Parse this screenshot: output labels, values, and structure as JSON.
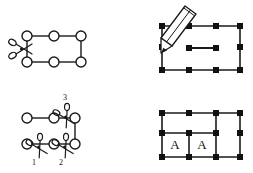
{
  "figure": {
    "background_color": "#ffffff",
    "stroke_color": "#1a1a1a",
    "node_fill_open": "#ffffff",
    "node_fill_solid": "#111111",
    "width": 253,
    "height": 173
  },
  "panels": [
    {
      "id": "top-left",
      "name": "single-cut-circle-graph",
      "caption": "",
      "node_style": "open-circle",
      "nodes": [
        {
          "id": "n1",
          "x": 27,
          "y": 36
        },
        {
          "id": "n2",
          "x": 54,
          "y": 36
        },
        {
          "id": "n3",
          "x": 81,
          "y": 36
        },
        {
          "id": "n4",
          "x": 27,
          "y": 62
        },
        {
          "id": "n5",
          "x": 54,
          "y": 62
        },
        {
          "id": "n6",
          "x": 81,
          "y": 62
        }
      ],
      "edges": [
        {
          "from": "n1",
          "to": "n2"
        },
        {
          "from": "n2",
          "to": "n3"
        },
        {
          "from": "n3",
          "to": "n6"
        },
        {
          "from": "n4",
          "to": "n5"
        },
        {
          "from": "n5",
          "to": "n6"
        },
        {
          "from": "n1",
          "to": "n4"
        }
      ],
      "scissors": [
        {
          "id": "s1",
          "x": 20,
          "y": 49,
          "rotation": 0,
          "label": ""
        }
      ]
    },
    {
      "id": "top-right",
      "name": "pencil-draw-grid",
      "caption": "",
      "node_style": "solid-square",
      "nodes": [
        {
          "id": "m1",
          "x": 162,
          "y": 26
        },
        {
          "id": "m2",
          "x": 189,
          "y": 26
        },
        {
          "id": "m3",
          "x": 216,
          "y": 26
        },
        {
          "id": "m4",
          "x": 240,
          "y": 26
        },
        {
          "id": "m5",
          "x": 162,
          "y": 47
        },
        {
          "id": "m6",
          "x": 240,
          "y": 47
        },
        {
          "id": "m7",
          "x": 162,
          "y": 70
        },
        {
          "id": "m8",
          "x": 189,
          "y": 70
        },
        {
          "id": "m9",
          "x": 216,
          "y": 70
        },
        {
          "id": "m10",
          "x": 240,
          "y": 70
        },
        {
          "id": "m11",
          "x": 189,
          "y": 48
        },
        {
          "id": "m12",
          "x": 216,
          "y": 48
        }
      ],
      "edges": [
        {
          "from": "m1",
          "to": "m4"
        },
        {
          "from": "m7",
          "to": "m10"
        },
        {
          "from": "m1",
          "to": "m7"
        },
        {
          "from": "m4",
          "to": "m10"
        },
        {
          "from": "m11",
          "to": "m12"
        }
      ],
      "pencil": {
        "tip_x": 163,
        "tip_y": 52,
        "tail_x": 192,
        "tail_y": 10
      }
    },
    {
      "id": "bottom-left",
      "name": "numbered-cuts-graph",
      "caption": "",
      "node_style": "open-circle",
      "nodes": [
        {
          "id": "p1",
          "x": 27,
          "y": 118
        },
        {
          "id": "p2",
          "x": 54,
          "y": 118
        },
        {
          "id": "p3",
          "x": 75,
          "y": 118
        },
        {
          "id": "p4",
          "x": 27,
          "y": 144
        },
        {
          "id": "p5",
          "x": 54,
          "y": 144
        },
        {
          "id": "p6",
          "x": 75,
          "y": 144
        }
      ],
      "edges": [
        {
          "from": "p1",
          "to": "p2"
        },
        {
          "from": "p2",
          "to": "p3"
        },
        {
          "from": "p3",
          "to": "p6"
        },
        {
          "from": "p4",
          "to": "p5"
        },
        {
          "from": "p5",
          "to": "p6"
        }
      ],
      "scissors": [
        {
          "id": "c1",
          "x": 38,
          "y": 148,
          "rotation": 0,
          "label": "1"
        },
        {
          "id": "c2",
          "x": 64,
          "y": 148,
          "rotation": 0,
          "label": "2"
        },
        {
          "id": "c3",
          "x": 65,
          "y": 112,
          "rotation": 0,
          "label": "3"
        }
      ],
      "cut_labels": [
        "1",
        "2",
        "3"
      ]
    },
    {
      "id": "bottom-right",
      "name": "labeled-cells-grid",
      "caption": "",
      "node_style": "solid-square",
      "nodes": [
        {
          "id": "q1",
          "x": 162,
          "y": 113
        },
        {
          "id": "q2",
          "x": 189,
          "y": 113
        },
        {
          "id": "q3",
          "x": 216,
          "y": 113
        },
        {
          "id": "q4",
          "x": 240,
          "y": 113
        },
        {
          "id": "q5",
          "x": 162,
          "y": 133
        },
        {
          "id": "q6",
          "x": 189,
          "y": 133
        },
        {
          "id": "q7",
          "x": 216,
          "y": 133
        },
        {
          "id": "q8",
          "x": 240,
          "y": 133
        },
        {
          "id": "q9",
          "x": 162,
          "y": 157
        },
        {
          "id": "q10",
          "x": 189,
          "y": 157
        },
        {
          "id": "q11",
          "x": 216,
          "y": 157
        },
        {
          "id": "q12",
          "x": 240,
          "y": 157
        }
      ],
      "edges": [
        {
          "from": "q1",
          "to": "q4"
        },
        {
          "from": "q5",
          "to": "q7"
        },
        {
          "from": "q9",
          "to": "q12"
        },
        {
          "from": "q1",
          "to": "q9"
        },
        {
          "from": "q4",
          "to": "q12"
        },
        {
          "from": "q3",
          "to": "q11"
        },
        {
          "from": "q6",
          "to": "q10"
        }
      ],
      "cells": [
        {
          "id": "cellA1",
          "label": "A",
          "cx": 175,
          "cy": 145
        },
        {
          "id": "cellA2",
          "label": "A",
          "cx": 202,
          "cy": 145
        }
      ]
    }
  ],
  "labels": {
    "cell_a_1": "A",
    "cell_a_2": "A",
    "cut_1": "1",
    "cut_2": "2",
    "cut_3": "3"
  }
}
